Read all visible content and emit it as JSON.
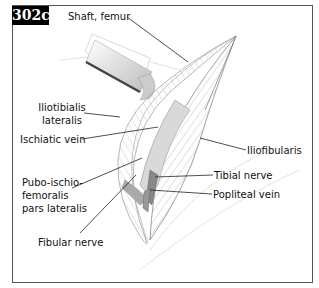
{
  "figure": {
    "label": "302c",
    "type": "anatomical-illustration"
  },
  "labels": {
    "shaft_femur": "Shaft, femur",
    "iliotibialis_line1": "Iliotibialis",
    "iliotibialis_line2": "lateralis",
    "ischiatic_vein": "Ischiatic vein",
    "iliofibularis": "Iliofibularis",
    "pubo_line1": "Pubo-ischio-",
    "pubo_line2": "femoralis",
    "pubo_line3": "pars lateralis",
    "tibial_nerve": "Tibial nerve",
    "popliteal_vein": "Popliteal vein",
    "fibular_nerve": "Fibular nerve"
  },
  "colors": {
    "label_bg": "#000000",
    "label_text": "#ffffff",
    "leader_line": "#222222",
    "muscle_fill": "#cfcfcf",
    "bone_fill": "#e8e8e8"
  }
}
